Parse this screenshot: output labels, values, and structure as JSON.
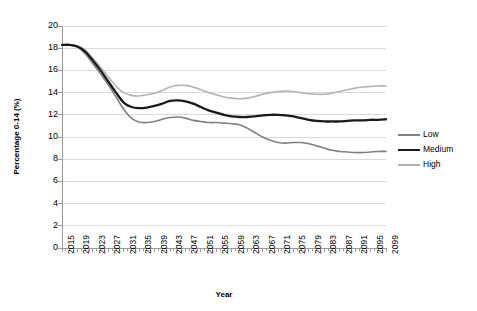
{
  "chart_data": {
    "type": "line",
    "title": "",
    "xlabel": "Year",
    "ylabel": "Percentage 0-14  (%)",
    "xlim": [
      2015,
      2099
    ],
    "ylim": [
      0,
      20
    ],
    "ytick_step": 2,
    "xtick_step": 4,
    "grid": true,
    "legend_position": "right",
    "yticks": [
      "0",
      "2",
      "4",
      "6",
      "8",
      "10",
      "12",
      "14",
      "16",
      "18",
      "20"
    ],
    "xticks": [
      "2015",
      "2019",
      "2023",
      "2027",
      "2031",
      "2035",
      "2039",
      "2043",
      "2047",
      "2051",
      "2055",
      "2059",
      "2063",
      "2067",
      "2071",
      "2075",
      "2079",
      "2083",
      "2087",
      "2091",
      "2095",
      "2099"
    ],
    "x": [
      2015,
      2017,
      2019,
      2021,
      2023,
      2025,
      2027,
      2029,
      2031,
      2033,
      2035,
      2037,
      2039,
      2041,
      2043,
      2045,
      2047,
      2049,
      2051,
      2053,
      2055,
      2057,
      2059,
      2061,
      2063,
      2065,
      2067,
      2069,
      2071,
      2073,
      2075,
      2077,
      2079,
      2081,
      2083,
      2085,
      2087,
      2089,
      2091,
      2093,
      2095,
      2097,
      2099
    ],
    "series": [
      {
        "name": "Low",
        "color": "#808080",
        "width": 1.6,
        "values": [
          18.3,
          18.3,
          18.1,
          17.5,
          16.6,
          15.7,
          14.7,
          13.6,
          12.5,
          11.7,
          11.35,
          11.3,
          11.4,
          11.6,
          11.75,
          11.8,
          11.7,
          11.5,
          11.4,
          11.3,
          11.3,
          11.25,
          11.2,
          11.1,
          10.8,
          10.4,
          10.0,
          9.7,
          9.5,
          9.45,
          9.5,
          9.5,
          9.4,
          9.2,
          9.0,
          8.8,
          8.7,
          8.65,
          8.6,
          8.6,
          8.65,
          8.7,
          8.7
        ]
      },
      {
        "name": "Medium",
        "color": "#1a1a1a",
        "width": 2.3,
        "values": [
          18.3,
          18.3,
          18.15,
          17.7,
          16.9,
          16.0,
          15.0,
          14.0,
          13.1,
          12.7,
          12.6,
          12.65,
          12.8,
          13.0,
          13.25,
          13.3,
          13.2,
          13.0,
          12.7,
          12.4,
          12.2,
          12.0,
          11.85,
          11.8,
          11.8,
          11.85,
          11.95,
          12.0,
          12.0,
          11.95,
          11.85,
          11.7,
          11.55,
          11.45,
          11.4,
          11.4,
          11.4,
          11.45,
          11.5,
          11.5,
          11.55,
          11.55,
          11.6
        ]
      },
      {
        "name": "High",
        "color": "#b3b3b3",
        "width": 1.6,
        "values": [
          18.3,
          18.3,
          18.2,
          17.85,
          17.1,
          16.3,
          15.4,
          14.6,
          14.0,
          13.75,
          13.7,
          13.8,
          13.95,
          14.2,
          14.5,
          14.65,
          14.65,
          14.5,
          14.25,
          14.0,
          13.8,
          13.6,
          13.5,
          13.45,
          13.5,
          13.65,
          13.85,
          14.0,
          14.1,
          14.15,
          14.1,
          14.0,
          13.9,
          13.85,
          13.85,
          13.95,
          14.1,
          14.25,
          14.4,
          14.5,
          14.55,
          14.6,
          14.6
        ]
      }
    ]
  },
  "axes": {
    "plot_left": 62,
    "plot_right": 386,
    "plot_top": 26,
    "plot_bottom": 248
  }
}
